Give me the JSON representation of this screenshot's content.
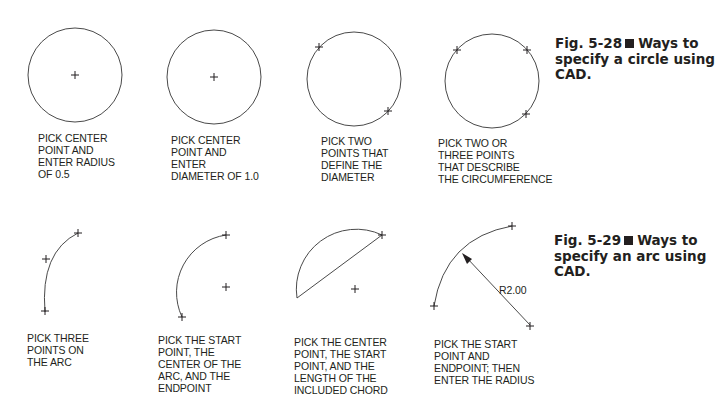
{
  "figures": [
    {
      "number": "Fig. 5-28",
      "title": "Ways to specify a circle using CAD.",
      "title_lines": [
        "Ways to",
        "specify a circle using",
        "CAD."
      ],
      "panels": [
        {
          "caption": "PICK CENTER\nPOINT AND\nENTER RADIUS\nOF 0.5",
          "shape": "circle",
          "picks": [
            "center"
          ]
        },
        {
          "caption": "PICK CENTER\nPOINT AND\nENTER\nDIAMETER OF 1.0",
          "shape": "circle",
          "picks": [
            "center"
          ]
        },
        {
          "caption": "PICK TWO\nPOINTS THAT\nDEFINE THE\nDIAMETER",
          "shape": "circle",
          "picks": [
            "diameter-point-1",
            "diameter-point-2"
          ]
        },
        {
          "caption": "PICK TWO OR\nTHREE POINTS\nTHAT DESCRIBE\nTHE CIRCUMFERENCE",
          "shape": "circle",
          "picks": [
            "point-1",
            "point-2",
            "point-3"
          ]
        }
      ]
    },
    {
      "number": "Fig. 5-29",
      "title": "Ways to specify an arc using CAD.",
      "title_lines": [
        "Ways to",
        "specify an arc using",
        "CAD."
      ],
      "panels": [
        {
          "caption": "PICK THREE\nPOINTS ON\nTHE ARC",
          "shape": "arc",
          "picks": [
            "start",
            "mid",
            "end"
          ]
        },
        {
          "caption": "PICK THE START\nPOINT, THE\nCENTER OF THE\nARC, AND THE\nENDPOINT",
          "shape": "arc",
          "picks": [
            "start",
            "center",
            "end"
          ]
        },
        {
          "caption": "PICK THE CENTER\nPOINT, THE START\nPOINT, AND THE\nLENGTH OF THE\nINCLUDED CHORD",
          "shape": "arc-with-chord",
          "picks": [
            "center",
            "start"
          ]
        },
        {
          "caption": "PICK THE START\nPOINT AND\nENDPOINT; THEN\nENTER THE RADIUS",
          "shape": "arc-with-radius",
          "picks": [
            "start",
            "end"
          ],
          "dimension_label": "R2.00"
        }
      ]
    }
  ],
  "colors": {
    "ink": "#231f20",
    "line": "#555555",
    "background": "#ffffff"
  }
}
